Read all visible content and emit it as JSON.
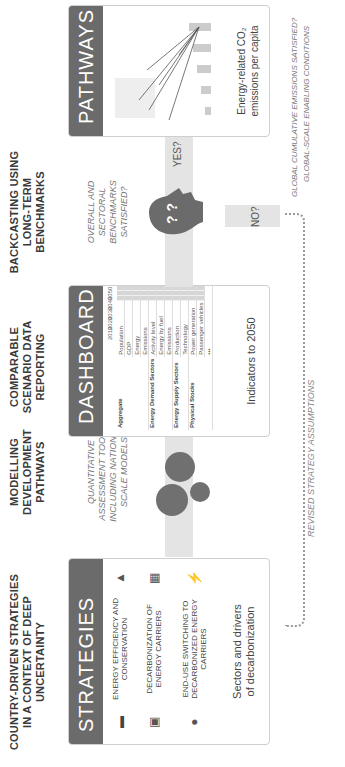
{
  "columns": [
    {
      "title": "COUNTRY-DRIVEN STRATEGIES IN A CONTEXT OF DEEP UNCERTAINTY"
    },
    {
      "title": "MODELLING DEVELOPMENT PATHWAYS"
    },
    {
      "title": "COMPARABLE SCENARIO DATA REPORTING"
    },
    {
      "title": "BACKCASTING USING LONG-TERM BENCHMARKS"
    }
  ],
  "strategies": {
    "header": "STRATEGIES",
    "items": [
      {
        "icon": "car-and-flame-icon",
        "label": "ENERGY EFFICIENCY AND CONSERVATION"
      },
      {
        "icon": "factory-and-building-icon",
        "label": "DECARBONIZATION OF ENERGY CARRIERS"
      },
      {
        "icon": "drop-and-lightning-icon",
        "label": "END-USE SWITCHING TO DECARBONIZED ENERGY CARRIERS"
      }
    ],
    "footer": "Sectors and drivers of decarbonization"
  },
  "modelling": {
    "subtitle": "QUANTITATIVE ASSESSMENT TOOLS, INCLUDING NATIONAL-SCALE MODELS"
  },
  "dashboard": {
    "header": "DASHBOARD",
    "years": [
      "2010",
      "2020",
      "2030",
      "2040",
      "2050"
    ],
    "groups": [
      {
        "name": "Aggregate",
        "rows": [
          "Population",
          "GDP",
          "Energy",
          "Emissions"
        ]
      },
      {
        "name": "Energy Demand Sectors",
        "rows": [
          "Activity level",
          "Energy by fuel",
          "Emissions"
        ]
      },
      {
        "name": "Energy Supply Sectors",
        "rows": [
          "Production",
          "Technology"
        ]
      },
      {
        "name": "Physical Stocks",
        "rows": [
          "Power generation",
          "Passenger vehicles",
          "•••"
        ]
      }
    ],
    "footer": "Indicators to 2050"
  },
  "backcasting": {
    "subtitle": "OVERALL AND SECTORAL BENCHMARKS SATISFIED?",
    "yes_label": "YES?",
    "no_label": "NO?"
  },
  "pathways": {
    "header": "PATHWAYS",
    "countries": [
      "CA",
      "FR",
      "AU",
      "KR",
      "US",
      "IN",
      "DE",
      "JP",
      "MX",
      "GB",
      "ZA",
      "ID",
      "CN",
      "IT",
      "BR"
    ],
    "x_ticks": [
      "2010",
      "2020",
      "2030",
      "2040",
      "2050"
    ],
    "footer": "Energy-related CO₂ emissions per capita"
  },
  "feedback_label": "REVISED STRATEGY ASSUMPTIONS",
  "global_question": "GLOBAL CUMULATIVE EMISSIONS SATISFIED?",
  "global_conditions": "GLOBAL-SCALE ENABLING CONDITIONS"
}
